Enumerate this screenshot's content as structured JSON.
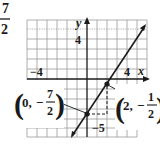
{
  "fraction_fragment": {
    "numerator": "7",
    "denominator": "2"
  },
  "graph": {
    "axis_labels": {
      "x": "x",
      "y": "y"
    },
    "tick_labels": {
      "y_pos": "4",
      "x_neg": "−4",
      "x_pos": "4",
      "y_neg": "−5"
    },
    "points": [
      {
        "name": "y-intercept",
        "x": 0,
        "y": -3.5,
        "label_open": "(",
        "label_x": "0,",
        "label_sign": "−",
        "label_num": "7",
        "label_den": "2",
        "label_close": ")"
      },
      {
        "name": "second-point",
        "x": 2,
        "y": -0.5,
        "label_open": "(",
        "label_x": "2,",
        "label_sign": "−",
        "label_num": "1",
        "label_den": "2",
        "label_close": ")"
      }
    ],
    "line": {
      "slope": 1.5,
      "intercept": -3.5
    },
    "rise_run": {
      "run": 2,
      "rise": 3
    },
    "colors": {
      "grid": "#9a9a9a",
      "axis": "#1a1a1a",
      "line": "#1a1a1a"
    }
  }
}
